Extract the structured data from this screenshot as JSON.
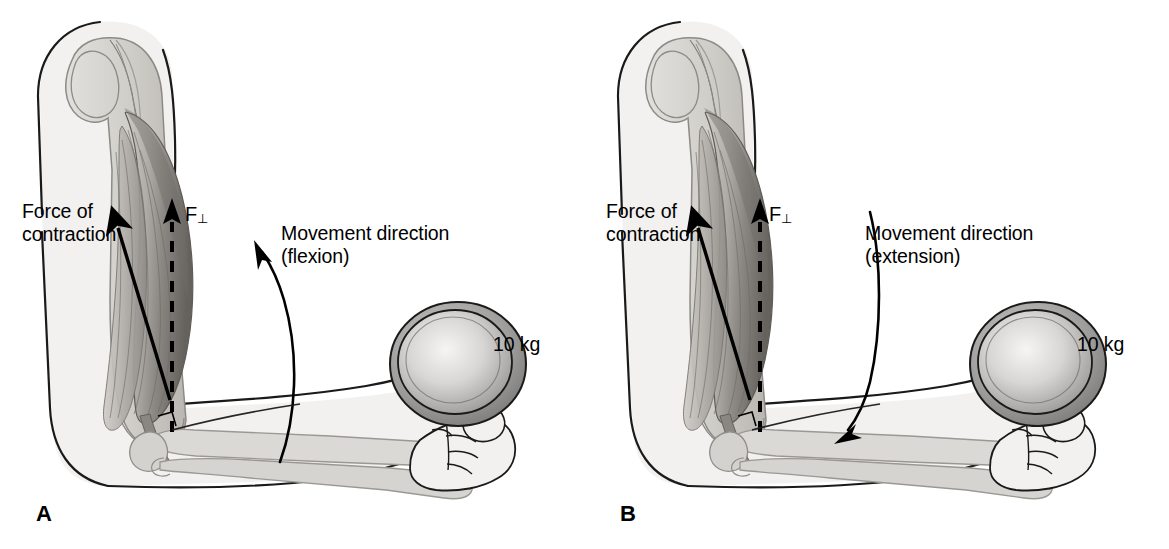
{
  "figure": {
    "faint_caption": ""
  },
  "colors": {
    "ink": "#000000",
    "skin_fill": "#f2f1ef",
    "skin_edge": "#1a1a1a",
    "bone_fill": "#d9d7d3",
    "bone_edge": "#8c8a86",
    "muscle_light": "#c8c5c0",
    "muscle_mid": "#9d9a95",
    "muscle_dark": "#6e6b67",
    "plate_rim": "#6f6f6f",
    "plate_face_light": "#f0efee",
    "plate_face_dark": "#8a8a8a",
    "background": "#ffffff"
  },
  "panels": [
    {
      "letter": "A",
      "labels": {
        "force_of_contraction": "Force of\ncontraction",
        "f_perpendicular": "F",
        "f_perpendicular_sub": "⊥",
        "movement_direction": "Movement direction\n(flexion)",
        "weight": "10 kg"
      },
      "icons": {
        "force_arrow": "force-of-contraction-arrow-icon",
        "perpendicular_arrow": "f-perpendicular-dashed-arrow-icon",
        "movement_arrow": "flexion-curved-arrow-icon",
        "right_angle": "right-angle-marker-icon"
      },
      "movement": "flexion",
      "movement_arrow_direction": "up-left"
    },
    {
      "letter": "B",
      "labels": {
        "force_of_contraction": "Force of\ncontraction",
        "f_perpendicular": "F",
        "f_perpendicular_sub": "⊥",
        "movement_direction": "Movement direction\n(extension)",
        "weight": "10 kg"
      },
      "icons": {
        "force_arrow": "force-of-contraction-arrow-icon",
        "perpendicular_arrow": "f-perpendicular-dashed-arrow-icon",
        "movement_arrow": "extension-curved-arrow-icon",
        "right_angle": "right-angle-marker-icon"
      },
      "movement": "extension",
      "movement_arrow_direction": "down-left"
    }
  ]
}
